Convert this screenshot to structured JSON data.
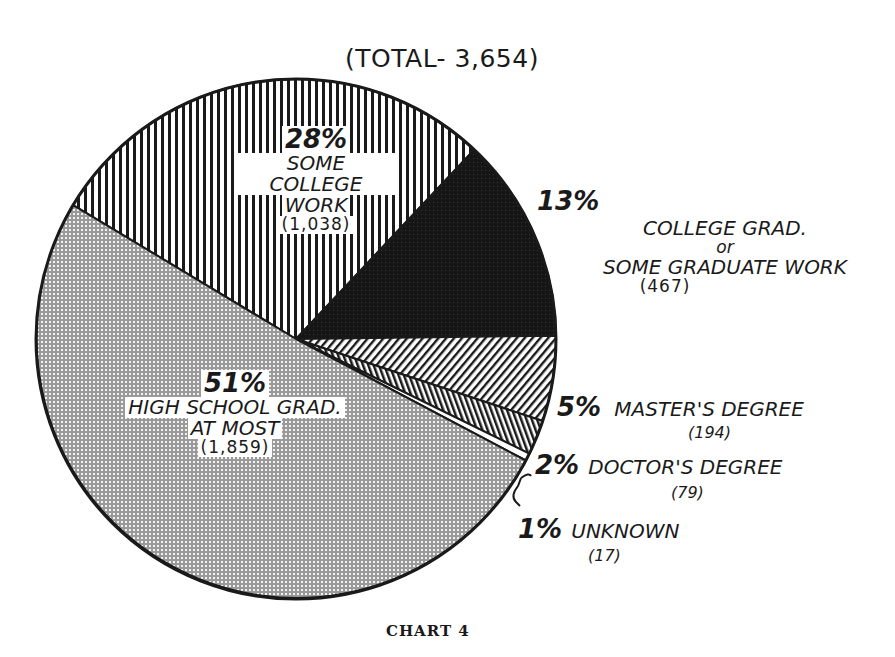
{
  "chart_data": {
    "type": "pie",
    "title": "(TOTAL- 3,654)",
    "caption": "CHART 4",
    "total": 3654,
    "slices": [
      {
        "label": "SOME COLLEGE WORK",
        "percent": 28,
        "count": 1038,
        "count_label": "(1,038)",
        "pattern": "vertical-stripes"
      },
      {
        "label": "COLLEGE GRAD. or SOME GRADUATE WORK",
        "percent": 13,
        "count": 467,
        "count_label": "(467)",
        "pattern": "solid-dark"
      },
      {
        "label": "MASTER'S DEGREE",
        "percent": 5,
        "count": 194,
        "count_label": "(194)",
        "pattern": "diagonal-stripes"
      },
      {
        "label": "DOCTOR'S DEGREE",
        "percent": 2,
        "count": 79,
        "count_label": "(79)",
        "pattern": "dense-vertical-stripes"
      },
      {
        "label": "UNKNOWN",
        "percent": 1,
        "count": 17,
        "count_label": "(17)",
        "pattern": "white"
      },
      {
        "label": "HIGH SCHOOL GRAD AT MOST",
        "percent": 51,
        "count": 1859,
        "count_label": "(1,859)",
        "pattern": "crosshatch-dots"
      }
    ]
  },
  "labels": {
    "some_college": {
      "pct": "28%",
      "line1": "SOME COLLEGE",
      "line2": "WORK",
      "count": "(1,038)"
    },
    "college_grad": {
      "pct": "13%",
      "line1": "COLLEGE GRAD.",
      "line2": "or",
      "line3": "SOME GRADUATE WORK",
      "count": "(467)"
    },
    "masters": {
      "pct": "5%",
      "line1": "MASTER'S DEGREE",
      "count": "(194)"
    },
    "doctors": {
      "pct": "2%",
      "line1": "DOCTOR'S DEGREE",
      "count": "(79)"
    },
    "unknown": {
      "pct": "1%",
      "line1": "UNKNOWN",
      "count": "(17)"
    },
    "high_school": {
      "pct": "51%",
      "line1": "HIGH SCHOOL GRAD.",
      "line2": "AT MOST",
      "count": "(1,859)"
    }
  }
}
